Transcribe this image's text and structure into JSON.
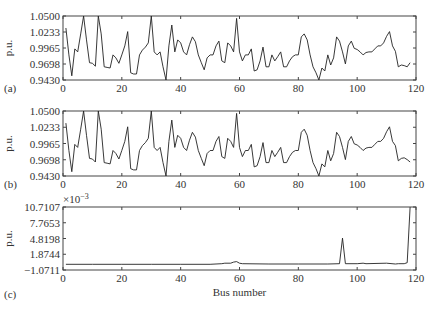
{
  "chart_data": [
    {
      "id": "a",
      "type": "line",
      "panel_label": "(a)",
      "ylabel": "p.u.",
      "xlabel": "",
      "xlim": [
        0,
        120
      ],
      "ylim": [
        0.943,
        1.05
      ],
      "xticks": [
        0,
        20,
        40,
        60,
        80,
        100,
        120
      ],
      "yticks": [
        "1.0500",
        "1.0233",
        "0.9965",
        "0.9698",
        "0.9430"
      ],
      "grid": false,
      "x": [
        1,
        2,
        3,
        4,
        5,
        6,
        7,
        8,
        9,
        10,
        11,
        12,
        13,
        14,
        15,
        16,
        17,
        18,
        19,
        20,
        21,
        22,
        23,
        24,
        25,
        26,
        27,
        28,
        29,
        30,
        31,
        32,
        33,
        34,
        35,
        36,
        37,
        38,
        39,
        40,
        41,
        42,
        43,
        44,
        45,
        46,
        47,
        48,
        49,
        50,
        51,
        52,
        53,
        54,
        55,
        56,
        57,
        58,
        59,
        60,
        61,
        62,
        63,
        64,
        65,
        66,
        67,
        68,
        69,
        70,
        71,
        72,
        73,
        74,
        75,
        76,
        77,
        78,
        79,
        80,
        81,
        82,
        83,
        84,
        85,
        86,
        87,
        88,
        89,
        90,
        91,
        92,
        93,
        94,
        95,
        96,
        97,
        98,
        99,
        100,
        101,
        102,
        103,
        104,
        105,
        106,
        107,
        108,
        109,
        110,
        111,
        112,
        113,
        114,
        115,
        116,
        117,
        118
      ],
      "values": [
        1.03,
        0.985,
        0.95,
        0.995,
        0.99,
        1.02,
        1.05,
        1.01,
        0.972,
        0.971,
        0.966,
        1.05,
        1.02,
        0.965,
        0.964,
        0.963,
        0.985,
        0.98,
        0.971,
        0.985,
        1.0,
        1.024,
        0.955,
        0.953,
        0.953,
        0.985,
        0.993,
        0.998,
        1.005,
        1.05,
        0.99,
        0.985,
        0.99,
        0.965,
        0.943,
        1.0,
        1.035,
        0.99,
        1.01,
        1.005,
        0.99,
        0.985,
        1.002,
        1.015,
        1.007,
        0.985,
        0.972,
        0.96,
        0.98,
        0.985,
        0.985,
        1.0,
        1.008,
        0.975,
        0.972,
        1.005,
        1.0,
        0.99,
        1.046,
        0.99,
        0.975,
        0.985,
        0.985,
        0.995,
        0.958,
        0.96,
        0.975,
        0.998,
        0.965,
        0.965,
        0.985,
        0.975,
        0.982,
        0.99,
        0.965,
        0.965,
        0.975,
        0.982,
        0.985,
        0.985,
        1.015,
        1.02,
        1.01,
        0.985,
        0.965,
        0.955,
        0.943,
        0.963,
        0.958,
        0.985,
        0.968,
        0.98,
        1.015,
        1.008,
        0.99,
        0.97,
        1.0,
        1.008,
        0.996,
        0.994,
        0.99,
        0.985,
        0.989,
        0.99,
        0.99,
        0.995,
        1.0,
        1.0,
        1.005,
        1.016,
        1.024,
        1.0,
        0.991,
        0.965,
        0.968,
        0.967,
        0.965,
        0.972,
        0.96,
        0.965,
        0.952
      ]
    },
    {
      "id": "b",
      "type": "line",
      "panel_label": "(b)",
      "ylabel": "p.u.",
      "xlabel": "",
      "xlim": [
        0,
        120
      ],
      "ylim": [
        0.943,
        1.05
      ],
      "xticks": [
        0,
        20,
        40,
        60,
        80,
        100,
        120
      ],
      "yticks": [
        "1.0500",
        "1.0233",
        "0.9965",
        "0.9698",
        "0.9430"
      ],
      "grid": false,
      "x": [
        1,
        2,
        3,
        4,
        5,
        6,
        7,
        8,
        9,
        10,
        11,
        12,
        13,
        14,
        15,
        16,
        17,
        18,
        19,
        20,
        21,
        22,
        23,
        24,
        25,
        26,
        27,
        28,
        29,
        30,
        31,
        32,
        33,
        34,
        35,
        36,
        37,
        38,
        39,
        40,
        41,
        42,
        43,
        44,
        45,
        46,
        47,
        48,
        49,
        50,
        51,
        52,
        53,
        54,
        55,
        56,
        57,
        58,
        59,
        60,
        61,
        62,
        63,
        64,
        65,
        66,
        67,
        68,
        69,
        70,
        71,
        72,
        73,
        74,
        75,
        76,
        77,
        78,
        79,
        80,
        81,
        82,
        83,
        84,
        85,
        86,
        87,
        88,
        89,
        90,
        91,
        92,
        93,
        94,
        95,
        96,
        97,
        98,
        99,
        100,
        101,
        102,
        103,
        104,
        105,
        106,
        107,
        108,
        109,
        110,
        111,
        112,
        113,
        114,
        115,
        116,
        117,
        118
      ],
      "values": [
        1.03,
        0.985,
        0.95,
        0.995,
        0.99,
        1.02,
        1.05,
        1.01,
        0.972,
        0.971,
        0.966,
        1.05,
        1.02,
        0.965,
        0.964,
        0.963,
        0.985,
        0.98,
        0.971,
        0.985,
        1.0,
        1.024,
        0.955,
        0.953,
        0.953,
        0.985,
        0.993,
        0.998,
        1.005,
        1.05,
        0.99,
        0.985,
        0.99,
        0.965,
        0.943,
        1.0,
        1.035,
        0.99,
        1.01,
        1.005,
        0.99,
        0.985,
        1.002,
        1.015,
        1.007,
        0.985,
        0.972,
        0.96,
        0.98,
        0.985,
        0.985,
        1.0,
        1.008,
        0.975,
        0.972,
        1.005,
        1.0,
        0.99,
        1.046,
        0.99,
        0.975,
        0.985,
        0.985,
        0.995,
        0.958,
        0.96,
        0.975,
        0.998,
        0.965,
        0.965,
        0.985,
        0.975,
        0.982,
        0.99,
        0.965,
        0.965,
        0.975,
        0.982,
        0.985,
        0.985,
        1.015,
        1.02,
        1.01,
        0.985,
        0.965,
        0.955,
        0.943,
        0.963,
        0.958,
        0.985,
        0.968,
        0.98,
        1.015,
        1.008,
        0.99,
        0.97,
        1.0,
        1.008,
        0.996,
        0.994,
        0.99,
        0.985,
        0.989,
        0.99,
        0.99,
        0.995,
        1.0,
        1.0,
        1.005,
        1.016,
        1.024,
        1.0,
        0.993,
        0.968,
        0.972,
        0.973,
        0.97,
        0.966,
        0.966,
        0.976,
        0.966
      ]
    },
    {
      "id": "c",
      "type": "line",
      "panel_label": "(c)",
      "ylabel": "p.u.",
      "xlabel": "Bus number",
      "y_scale_label": "×10−3",
      "xlim": [
        0,
        120
      ],
      "ylim": [
        -1.0711,
        10.7107
      ],
      "xticks": [
        0,
        20,
        40,
        60,
        80,
        100,
        120
      ],
      "yticks": [
        "10.7107",
        "7.7653",
        "4.8198",
        "1.8744",
        "−1.0711"
      ],
      "grid": false,
      "x": [
        1,
        10,
        20,
        30,
        40,
        50,
        54,
        55,
        57,
        58,
        59,
        60,
        61,
        70,
        80,
        90,
        94,
        95,
        96,
        100,
        102,
        103,
        110,
        113,
        114,
        116,
        117,
        118
      ],
      "values": [
        0,
        0,
        0,
        0,
        0,
        0,
        0.1,
        0.2,
        0.2,
        0.4,
        0.5,
        0.2,
        0.1,
        0.05,
        0.05,
        0.05,
        0.1,
        4.9,
        0.1,
        0.1,
        0.2,
        0.1,
        0.2,
        0.05,
        0.1,
        0.1,
        0.3,
        10.7
      ]
    }
  ],
  "labels": {
    "a_panel": "(a)",
    "b_panel": "(b)",
    "c_panel": "(c)",
    "ylabel": "p.u.",
    "xlabel": "Bus number",
    "c_scale": "×10",
    "c_scale_exp": "−3",
    "xticks": [
      "0",
      "20",
      "40",
      "60",
      "80",
      "100",
      "120"
    ],
    "ab_yticks": [
      "1.0500",
      "1.0233",
      "0.9965",
      "0.9698",
      "0.9430"
    ],
    "c_yticks": [
      "10.7107",
      "7.7653",
      "4.8198",
      "1.8744",
      "−1.0711"
    ]
  }
}
